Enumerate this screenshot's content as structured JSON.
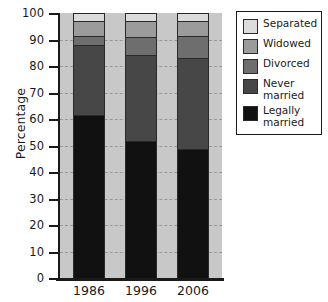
{
  "chart_data": {
    "type": "bar",
    "subtype": "stacked-bar-100-percent",
    "title": "",
    "xlabel": "",
    "ylabel": "Percentage",
    "ylim": [
      0,
      100
    ],
    "yticks": [
      0,
      10,
      20,
      30,
      40,
      50,
      60,
      70,
      80,
      90,
      100
    ],
    "ytick_labels": [
      "0",
      "10",
      "20",
      "30",
      "40",
      "50",
      "60",
      "70",
      "80",
      "90",
      "100"
    ],
    "grid": true,
    "grid_axis": "y",
    "legend_position": "right",
    "categories": [
      "1986",
      "1996",
      "2006"
    ],
    "series": [
      {
        "name": "Legally married",
        "values": [
          61.5,
          51.7,
          48.5
        ],
        "color": "#111111"
      },
      {
        "name": "Never married",
        "values": [
          26.5,
          32.3,
          34.5
        ],
        "color": "#474747"
      },
      {
        "name": "Divorced",
        "values": [
          3.5,
          7.0,
          8.5
        ],
        "color": "#6e6e6e"
      },
      {
        "name": "Widowed",
        "values": [
          5.5,
          6.0,
          5.5
        ],
        "color": "#9b9b9b"
      },
      {
        "name": "Separated",
        "values": [
          3.0,
          3.0,
          3.0
        ],
        "color": "#dcdcdc"
      }
    ],
    "plot_background_color": "#c8c8c8",
    "axis_color": "#1a1a1a",
    "gridline_color": "#9a9a9a"
  },
  "axis": {
    "y_title": "Percentage"
  },
  "legend": {
    "entries": [
      {
        "label": "Separated",
        "color": "#dcdcdc"
      },
      {
        "label": "Widowed",
        "color": "#9b9b9b"
      },
      {
        "label": "Divorced",
        "color": "#6e6e6e"
      },
      {
        "label": "Never\nmarried",
        "color": "#474747"
      },
      {
        "label": "Legally\nmarried",
        "color": "#111111"
      }
    ]
  }
}
